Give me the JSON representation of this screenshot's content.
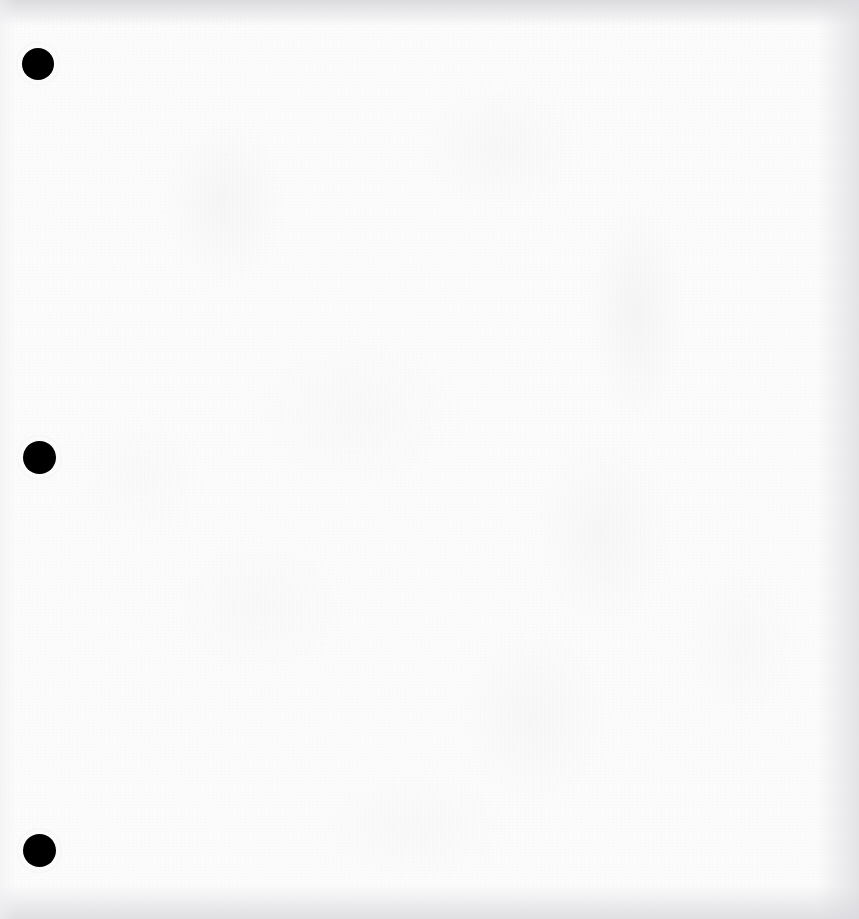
{
  "document": {
    "kind": "scanned-page",
    "page_label": "",
    "body_text": "",
    "width": 859,
    "height": 919,
    "background_color": "#fcfcfc",
    "ink_color": "#000000",
    "notes_visible_text": []
  },
  "binder_holes": {
    "count": 3,
    "color": "#000000",
    "items": [
      {
        "name": "hole-punch-top",
        "cx": 38,
        "cy": 64,
        "d": 32
      },
      {
        "name": "hole-punch-middle",
        "cx": 39,
        "cy": 457,
        "d": 33
      },
      {
        "name": "hole-punch-bottom",
        "cx": 39,
        "cy": 850,
        "d": 33
      }
    ]
  },
  "scan_artifacts": {
    "edge_shadow_color": "#d8d8dc",
    "grain_color": "#ececf0",
    "edges": [
      "top",
      "right",
      "bottom",
      "left"
    ]
  }
}
